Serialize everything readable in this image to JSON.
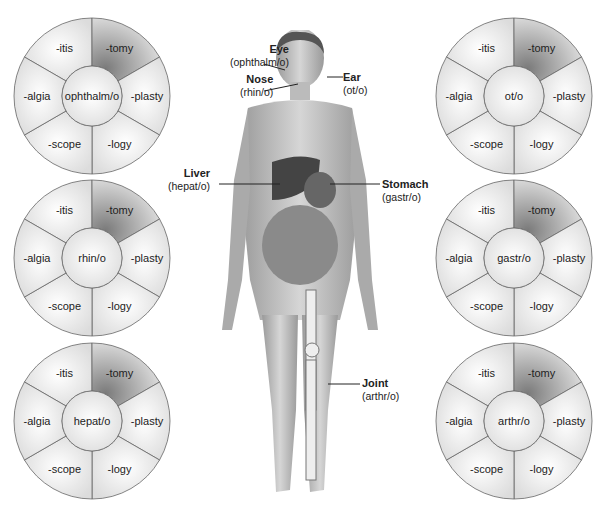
{
  "suffixes": [
    "-itis",
    "-tomy",
    "-plasty",
    "-logy",
    "-scope",
    "-algia"
  ],
  "wheels": [
    {
      "root": "ophthalm/o",
      "cx": 92,
      "cy": 96
    },
    {
      "root": "rhin/o",
      "cx": 92,
      "cy": 258
    },
    {
      "root": "hepat/o",
      "cx": 92,
      "cy": 421
    },
    {
      "root": "ot/o",
      "cx": 514,
      "cy": 96
    },
    {
      "root": "gastr/o",
      "cx": 514,
      "cy": 258
    },
    {
      "root": "arthr/o",
      "cx": 514,
      "cy": 421
    }
  ],
  "labels": {
    "eye": {
      "name": "Eye",
      "root": "(ophthalm/o)"
    },
    "nose": {
      "name": "Nose",
      "root": "(rhin/o)"
    },
    "ear": {
      "name": "Ear",
      "root": "(ot/o)"
    },
    "liver": {
      "name": "Liver",
      "root": "(hepat/o)"
    },
    "stomach": {
      "name": "Stomach",
      "root": "(gastr/o)"
    },
    "joint": {
      "name": "Joint",
      "root": "(arthr/o)"
    }
  },
  "colors": {
    "dark_segment": "#8a8a8a",
    "light_segment": "#f2f2f2",
    "line": "#555555"
  }
}
